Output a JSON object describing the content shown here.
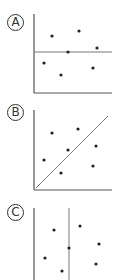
{
  "panels": [
    {
      "label": "A",
      "label_pos": [
        15,
        22
      ],
      "axes": {
        "origin": [
          34,
          93
        ],
        "x_end": 112,
        "y_top": 14
      },
      "reference_line": {
        "type": "horizontal",
        "x1": 34,
        "y1": 52,
        "x2": 112,
        "y2": 52
      },
      "points": [
        [
          52,
          36
        ],
        [
          79,
          31
        ],
        [
          97,
          48
        ],
        [
          68,
          52
        ],
        [
          44,
          63
        ],
        [
          61,
          75
        ],
        [
          93,
          68
        ]
      ]
    },
    {
      "label": "B",
      "label_pos": [
        15,
        112
      ],
      "axes": {
        "origin": [
          34,
          190
        ],
        "x_end": 112,
        "y_top": 110
      },
      "reference_line": {
        "type": "diagonal",
        "x1": 36,
        "y1": 188,
        "x2": 108,
        "y2": 116
      },
      "points": [
        [
          52,
          133
        ],
        [
          78,
          129
        ],
        [
          96,
          146
        ],
        [
          68,
          150
        ],
        [
          44,
          160
        ],
        [
          93,
          166
        ],
        [
          61,
          173
        ]
      ]
    },
    {
      "label": "C",
      "label_pos": [
        15,
        212
      ],
      "axes": {
        "origin": [
          34,
          280
        ],
        "x_end": 34,
        "y_top": 208
      },
      "reference_line": {
        "type": "vertical",
        "x1": 69,
        "y1": 208,
        "x2": 69,
        "y2": 280
      },
      "points": [
        [
          54,
          230
        ],
        [
          80,
          226
        ],
        [
          99,
          244
        ],
        [
          69,
          248
        ],
        [
          45,
          258
        ],
        [
          96,
          264
        ],
        [
          62,
          271
        ]
      ]
    }
  ],
  "colors": {
    "axis": "#555555",
    "reference_line": "#777777",
    "point": "#222222",
    "label": "#333333"
  }
}
